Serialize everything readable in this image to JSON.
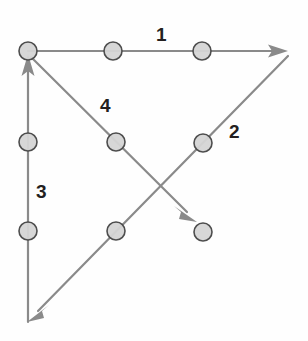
{
  "figure": {
    "background_color": "#fefefe",
    "width": 308,
    "height": 341
  },
  "style": {
    "line_color": "#8a8a8a",
    "line_width": 2.2,
    "arrow_color": "#8a8a8a",
    "node_fill": "#d5d5d5",
    "node_stroke": "#4d4d4d",
    "node_stroke_width": 1.6,
    "node_radius": 9,
    "label_color": "#231f20",
    "label_font_size": "19px"
  },
  "labels": [
    {
      "id": "label-1",
      "text": "1",
      "x": 156,
      "y": 25
    },
    {
      "id": "label-2",
      "text": "2",
      "x": 229,
      "y": 122
    },
    {
      "id": "label-3",
      "text": "3",
      "x": 36,
      "y": 182
    },
    {
      "id": "label-4",
      "text": "4",
      "x": 100,
      "y": 96
    }
  ],
  "vectors": [
    {
      "id": "vector-1",
      "label": "1",
      "direction": "right",
      "start": {
        "x": 28,
        "y": 51
      },
      "end": {
        "x": 287,
        "y": 51
      },
      "arrowhead": "end"
    },
    {
      "id": "vector-2",
      "label": "2",
      "direction": "up-right",
      "start": {
        "x": 31,
        "y": 318
      },
      "end": {
        "x": 288,
        "y": 56
      },
      "arrowhead": "none"
    },
    {
      "id": "vector-3",
      "label": "3",
      "direction": "up",
      "start": {
        "x": 28,
        "y": 322
      },
      "end": {
        "x": 28,
        "y": 56
      },
      "arrowhead": "end"
    },
    {
      "id": "vector-4",
      "label": "4",
      "direction": "down-right",
      "start": {
        "x": 30,
        "y": 58
      },
      "end": {
        "x": 197,
        "y": 223
      },
      "arrowhead": "end"
    },
    {
      "id": "vector-2-tail",
      "label": "2",
      "direction": "down-left",
      "start": {
        "x": 288,
        "y": 56
      },
      "end": {
        "x": 27,
        "y": 321
      },
      "arrowhead": "end"
    }
  ],
  "nodes": [
    {
      "id": "node-origin",
      "x": 28,
      "y": 51,
      "on": "vector-1-start"
    },
    {
      "id": "node-top-mid-left",
      "x": 113,
      "y": 51,
      "on": "vector-1"
    },
    {
      "id": "node-top-mid-right",
      "x": 202,
      "y": 51,
      "on": "vector-1"
    },
    {
      "id": "node-left-upper",
      "x": 28,
      "y": 142,
      "on": "vector-3"
    },
    {
      "id": "node-left-lower",
      "x": 28,
      "y": 231,
      "on": "vector-3"
    },
    {
      "id": "node-diag4-mid",
      "x": 116,
      "y": 142,
      "on": "vector-4"
    },
    {
      "id": "node-diag2-lower",
      "x": 116,
      "y": 231,
      "on": "vector-2"
    },
    {
      "id": "node-diag2-upper",
      "x": 203,
      "y": 143,
      "on": "vector-2"
    },
    {
      "id": "node-vector4-tip",
      "x": 203,
      "y": 232,
      "on": "vector-4-end"
    }
  ],
  "chart_data": {
    "type": "diagram",
    "annotations": [
      "1",
      "2",
      "3",
      "4"
    ],
    "vector_count": 4,
    "node_count": 9
  }
}
